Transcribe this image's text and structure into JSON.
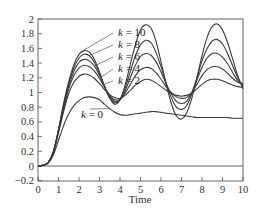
{
  "chart_data": {
    "type": "line",
    "title": "",
    "xlabel": "Time",
    "ylabel": "",
    "xlim": [
      0,
      10
    ],
    "ylim": [
      -0.2,
      2
    ],
    "grid": false,
    "legend": "none (inline annotations)",
    "x_ticks": [
      "0",
      "1",
      "2",
      "3",
      "4",
      "5",
      "6",
      "7",
      "8",
      "9",
      "10"
    ],
    "y_ticks": [
      "−0.2",
      "0",
      "0.2",
      "0.4",
      "0.6",
      "0.8",
      "1",
      "1.2",
      "1.4",
      "1.6",
      "1.8",
      "2"
    ],
    "x": [
      0,
      0.25,
      0.5,
      0.75,
      1.0,
      1.25,
      1.5,
      1.75,
      2.0,
      2.25,
      2.5,
      2.75,
      3.0,
      3.25,
      3.5,
      3.75,
      4.0,
      4.25,
      4.5,
      4.75,
      5.0,
      5.25,
      5.5,
      5.75,
      6.0,
      6.25,
      6.5,
      6.75,
      7.0,
      7.25,
      7.5,
      7.75,
      8.0,
      8.25,
      8.5,
      8.75,
      9.0,
      9.25,
      9.5,
      9.75,
      10.0
    ],
    "series": [
      {
        "name": "k = 10",
        "values": [
          0,
          0.01,
          0.05,
          0.2,
          0.5,
          0.85,
          1.15,
          1.38,
          1.52,
          1.57,
          1.55,
          1.45,
          1.28,
          1.08,
          0.92,
          0.84,
          0.9,
          1.1,
          1.38,
          1.65,
          1.85,
          1.92,
          1.88,
          1.7,
          1.42,
          1.12,
          0.85,
          0.68,
          0.64,
          0.72,
          0.92,
          1.2,
          1.5,
          1.75,
          1.9,
          1.93,
          1.85,
          1.68,
          1.45,
          1.22,
          1.05
        ]
      },
      {
        "name": "k = 8",
        "values": [
          0,
          0.01,
          0.05,
          0.2,
          0.49,
          0.83,
          1.12,
          1.34,
          1.47,
          1.52,
          1.5,
          1.41,
          1.26,
          1.08,
          0.93,
          0.86,
          0.9,
          1.06,
          1.28,
          1.5,
          1.65,
          1.71,
          1.68,
          1.55,
          1.35,
          1.13,
          0.93,
          0.8,
          0.77,
          0.82,
          0.98,
          1.2,
          1.43,
          1.6,
          1.7,
          1.72,
          1.66,
          1.53,
          1.36,
          1.2,
          1.08
        ]
      },
      {
        "name": "k = 6",
        "values": [
          0,
          0.01,
          0.05,
          0.19,
          0.48,
          0.81,
          1.09,
          1.29,
          1.41,
          1.45,
          1.43,
          1.36,
          1.23,
          1.08,
          0.95,
          0.88,
          0.9,
          1.02,
          1.2,
          1.37,
          1.49,
          1.53,
          1.51,
          1.42,
          1.28,
          1.12,
          0.98,
          0.88,
          0.85,
          0.88,
          1.0,
          1.17,
          1.34,
          1.47,
          1.53,
          1.53,
          1.48,
          1.39,
          1.27,
          1.16,
          1.1
        ]
      },
      {
        "name": "k = 4",
        "values": [
          0,
          0.01,
          0.05,
          0.19,
          0.47,
          0.78,
          1.05,
          1.23,
          1.33,
          1.37,
          1.35,
          1.29,
          1.19,
          1.07,
          0.96,
          0.9,
          0.91,
          0.99,
          1.11,
          1.23,
          1.31,
          1.34,
          1.33,
          1.27,
          1.18,
          1.08,
          1.0,
          0.94,
          0.92,
          0.93,
          1.0,
          1.11,
          1.23,
          1.31,
          1.35,
          1.35,
          1.32,
          1.26,
          1.19,
          1.14,
          1.12
        ]
      },
      {
        "name": "k = 2",
        "values": [
          0,
          0.01,
          0.05,
          0.18,
          0.45,
          0.74,
          0.99,
          1.14,
          1.22,
          1.25,
          1.24,
          1.19,
          1.12,
          1.04,
          0.97,
          0.93,
          0.92,
          0.96,
          1.03,
          1.1,
          1.15,
          1.18,
          1.17,
          1.13,
          1.08,
          1.03,
          0.99,
          0.96,
          0.95,
          0.96,
          0.99,
          1.05,
          1.11,
          1.16,
          1.18,
          1.18,
          1.16,
          1.13,
          1.1,
          1.08,
          1.07
        ]
      },
      {
        "name": "k = 0",
        "values": [
          0,
          0.01,
          0.04,
          0.15,
          0.35,
          0.55,
          0.71,
          0.82,
          0.89,
          0.93,
          0.94,
          0.93,
          0.9,
          0.84,
          0.78,
          0.73,
          0.7,
          0.69,
          0.7,
          0.71,
          0.72,
          0.73,
          0.74,
          0.74,
          0.73,
          0.72,
          0.71,
          0.7,
          0.69,
          0.68,
          0.67,
          0.66,
          0.66,
          0.66,
          0.66,
          0.66,
          0.66,
          0.66,
          0.65,
          0.65,
          0.65
        ]
      }
    ],
    "reference_lines": [
      {
        "axis": "y",
        "value": 0
      }
    ],
    "annotations": [
      {
        "text": "k = 10",
        "series": "k = 10"
      },
      {
        "text": "k = 8",
        "series": "k = 8"
      },
      {
        "text": "k = 6",
        "series": "k = 6"
      },
      {
        "text": "k = 4",
        "series": "k = 4"
      },
      {
        "text": "k = 2",
        "series": "k = 2"
      },
      {
        "text": "k = 0",
        "series": "k = 0"
      }
    ]
  },
  "style": {
    "line_color": "#3a3a3a",
    "axis_color": "#555555",
    "text_color": "#333333",
    "background": "#ffffff"
  }
}
